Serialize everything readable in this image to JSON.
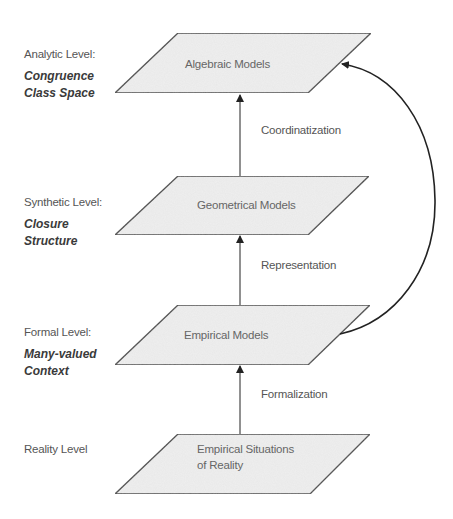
{
  "levels": [
    {
      "level_label": "Analytic Level:",
      "concept_line1": "Congruence",
      "concept_line2": "Class Space",
      "model_line1": "Algebraic Models",
      "model_line2": ""
    },
    {
      "level_label": "Synthetic Level:",
      "concept_line1": "Closure",
      "concept_line2": "Structure",
      "model_line1": "Geometrical Models",
      "model_line2": ""
    },
    {
      "level_label": "Formal Level:",
      "concept_line1": "Many-valued",
      "concept_line2": "Context",
      "model_line1": "Empirical Models",
      "model_line2": ""
    },
    {
      "level_label": "Reality Level",
      "concept_line1": "",
      "concept_line2": "",
      "model_line1": "Empirical Situations",
      "model_line2": "of Reality"
    }
  ],
  "edges": [
    {
      "label": "Coordinatization",
      "from": "Geometrical Models",
      "to": "Algebraic Models"
    },
    {
      "label": "Representation",
      "from": "Empirical Models",
      "to": "Geometrical Models"
    },
    {
      "label": "Formalization",
      "from": "Empirical Situations of Reality",
      "to": "Empirical Models"
    },
    {
      "label": "",
      "from": "Empirical Models",
      "to": "Algebraic Models",
      "style": "curved"
    }
  ],
  "colors": {
    "node_fill": "#efefef",
    "node_stroke": "#444444",
    "arrow": "#222222",
    "text": "#555555"
  }
}
